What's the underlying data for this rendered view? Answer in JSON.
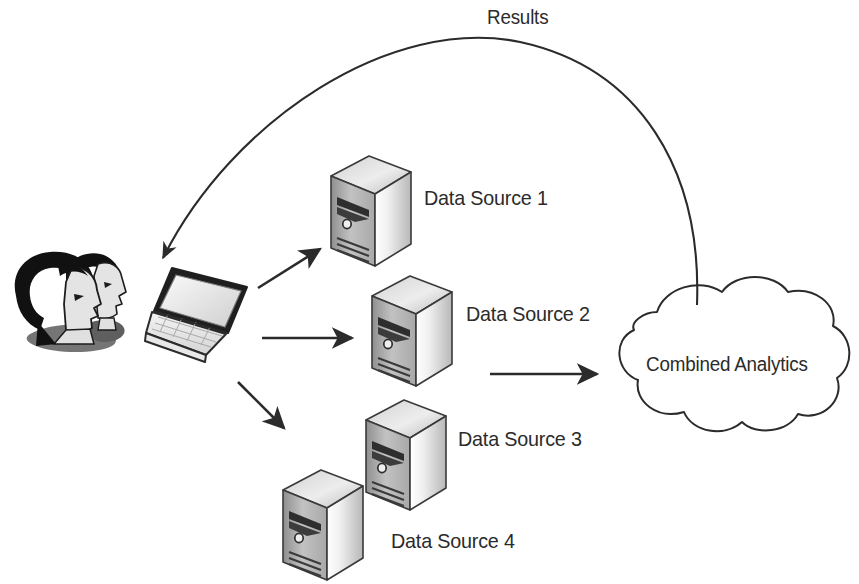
{
  "diagram": {
    "background_color": "#ffffff",
    "line_color": "#2b2b2b",
    "text_color": "#2b2b2b",
    "labels": {
      "results": "Results",
      "combined_analytics": "Combined Analytics"
    },
    "data_sources": [
      {
        "label": "Data Source 1"
      },
      {
        "label": "Data Source 2"
      },
      {
        "label": "Data Source 3"
      },
      {
        "label": "Data Source 4"
      }
    ],
    "nodes": {
      "users": "users-pair",
      "laptop": "laptop",
      "cloud": "cloud"
    },
    "arrows": [
      {
        "name": "laptop-to-data-source-1"
      },
      {
        "name": "laptop-to-data-source-2"
      },
      {
        "name": "laptop-to-data-source-4"
      },
      {
        "name": "data-sources-to-cloud"
      },
      {
        "name": "results-cloud-to-laptop"
      }
    ],
    "colors": {
      "server_face_left": "#b3b3b3",
      "server_face_right": "#f2f2f2",
      "server_top": "#d8d8d8",
      "outline": "#2b2b2b",
      "hair": "#111111",
      "skin": "#e4e4e4",
      "shadow": "#6e6e6e"
    }
  }
}
